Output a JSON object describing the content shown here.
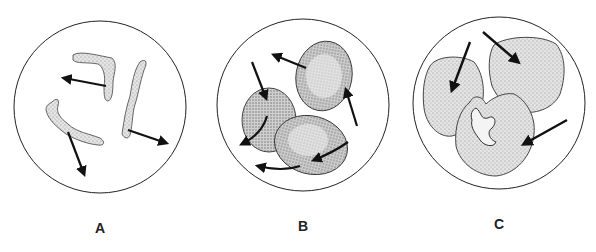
{
  "figure": {
    "panels": [
      {
        "id": "A",
        "label": "A",
        "description": "three elongated irregular stippled fragments with outward arrows"
      },
      {
        "id": "B",
        "label": "B",
        "description": "three oval stippled cells with curved and straight arrows"
      },
      {
        "id": "C",
        "label": "C",
        "description": "three large stippled cells fusing, with inward arrows"
      }
    ],
    "colors": {
      "outline": "#222222",
      "stipple": "#bdbdbd",
      "arrow": "#111111",
      "background": "#ffffff"
    }
  }
}
